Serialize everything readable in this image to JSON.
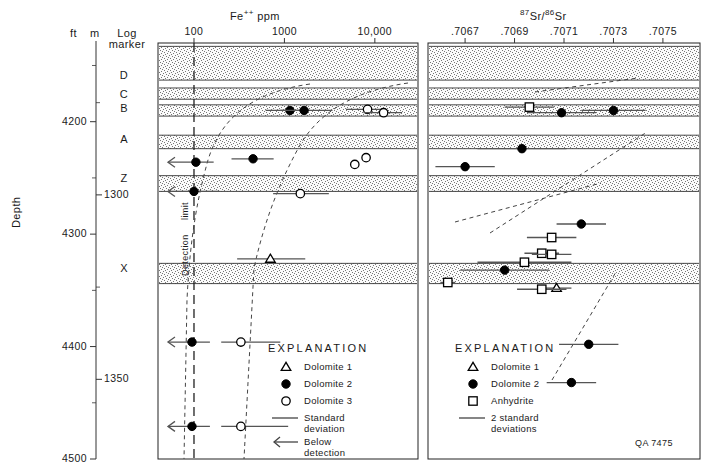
{
  "figure": {
    "id_label": "QA 7475",
    "depth_axis": {
      "axis_title": "Depth",
      "unit_left": "ft",
      "unit_right": "m",
      "ft_labels": [
        "4200",
        "4300",
        "4400",
        "4500"
      ],
      "ft_values": [
        4200,
        4300,
        4400,
        4500
      ],
      "m_labels": [
        "1300",
        "1350"
      ],
      "m_values": [
        1300,
        1350
      ],
      "ft_range": [
        4130,
        4500
      ]
    },
    "log_marker": {
      "header_line1": "Log",
      "header_line2": "marker",
      "markers": [
        {
          "label": "D",
          "depth_ft": 4160
        },
        {
          "label": "C",
          "depth_ft": 4177
        },
        {
          "label": "B",
          "depth_ft": 4190
        },
        {
          "label": "A",
          "depth_ft": 4217
        },
        {
          "label": "Z",
          "depth_ft": 4252
        },
        {
          "label": "X",
          "depth_ft": 4332
        }
      ]
    },
    "strat_bands": [
      {
        "top_ft": 4133,
        "bottom_ft": 4163
      },
      {
        "top_ft": 4170,
        "bottom_ft": 4180
      },
      {
        "top_ft": 4185,
        "bottom_ft": 4195
      },
      {
        "top_ft": 4212,
        "bottom_ft": 4224
      },
      {
        "top_ft": 4248,
        "bottom_ft": 4262
      },
      {
        "top_ft": 4326,
        "bottom_ft": 4344
      }
    ]
  },
  "chart_data": [
    {
      "type": "scatter",
      "panel": "left",
      "title": "Fe++ ppm",
      "title_base": "Fe",
      "title_sup": "++",
      "title_unit": "ppm",
      "xlabel": "Fe++ ppm",
      "ylabel": "Depth",
      "xscale": "log",
      "xlim": [
        40,
        30000
      ],
      "xticks": [
        100,
        1000,
        10000
      ],
      "xticklabels": [
        "100",
        "1000",
        "10,000"
      ],
      "ylim_ft": [
        4130,
        4500
      ],
      "grid": false,
      "detection_limit": {
        "value": 100,
        "label_line1": "Detection",
        "label_line2": "limit"
      },
      "series": [
        {
          "name": "Dolomite 1",
          "marker": "open-triangle",
          "points": [
            {
              "x": 700,
              "depth_ft": 4322,
              "err_lo": 300,
              "err_hi": 1700,
              "below_detection": false
            }
          ]
        },
        {
          "name": "Dolomite 2",
          "marker": "filled-circle",
          "points": [
            {
              "x": 1150,
              "depth_ft": 4190,
              "err_lo": 620,
              "err_hi": 1900,
              "below_detection": false
            },
            {
              "x": 1650,
              "depth_ft": 4190,
              "err_lo": 900,
              "err_hi": 3400,
              "below_detection": false
            },
            {
              "x": 105,
              "depth_ft": 4236,
              "err_lo": 70,
              "err_hi": 165,
              "below_detection": true
            },
            {
              "x": 450,
              "depth_ft": 4233,
              "err_lo": 260,
              "err_hi": 760,
              "below_detection": false
            },
            {
              "x": 100,
              "depth_ft": 4262,
              "err_lo": 70,
              "err_hi": 190,
              "below_detection": true
            },
            {
              "x": 95,
              "depth_ft": 4396,
              "err_lo": 70,
              "err_hi": 150,
              "below_detection": true
            },
            {
              "x": 95,
              "depth_ft": 4471,
              "err_lo": 70,
              "err_hi": 150,
              "below_detection": true
            }
          ]
        },
        {
          "name": "Dolomite 3",
          "marker": "open-circle",
          "points": [
            {
              "x": 8300,
              "depth_ft": 4189,
              "err_lo": 4800,
              "err_hi": 12000,
              "below_detection": false
            },
            {
              "x": 12500,
              "depth_ft": 4192,
              "err_lo": 7500,
              "err_hi": 20000,
              "below_detection": false
            },
            {
              "x": 6000,
              "depth_ft": 4238,
              "err_lo": 6000,
              "err_hi": 6000,
              "below_detection": false
            },
            {
              "x": 8000,
              "depth_ft": 4232,
              "err_lo": 8000,
              "err_hi": 8000,
              "below_detection": false
            },
            {
              "x": 1500,
              "depth_ft": 4264,
              "err_lo": 750,
              "err_hi": 3100,
              "below_detection": false
            },
            {
              "x": 330,
              "depth_ft": 4396,
              "err_lo": 200,
              "err_hi": 900,
              "below_detection": false
            },
            {
              "x": 330,
              "depth_ft": 4471,
              "err_lo": 200,
              "err_hi": 1100,
              "below_detection": false
            }
          ]
        }
      ],
      "trend_curves": [
        {
          "name": "dolomite-2-trend"
        },
        {
          "name": "dolomite-3-trend"
        }
      ],
      "legend": {
        "title": "EXPLANATION",
        "entries": [
          {
            "symbol": "open-triangle",
            "label": "Dolomite 1"
          },
          {
            "symbol": "filled-circle",
            "label": "Dolomite 2"
          },
          {
            "symbol": "open-circle",
            "label": "Dolomite 3"
          },
          {
            "symbol": "h-line",
            "label": "Standard deviation",
            "line1": "Standard",
            "line2": "deviation"
          },
          {
            "symbol": "left-arrow",
            "label": "Below detection",
            "line1": "Below",
            "line2": "detection"
          }
        ]
      }
    },
    {
      "type": "scatter",
      "panel": "right",
      "title": "87Sr/86Sr",
      "title_sup1": "87",
      "title_base1": "Sr",
      "title_slash": "/",
      "title_sup2": "86",
      "title_base2": "Sr",
      "xlabel": "87Sr/86Sr",
      "ylabel": "Depth",
      "xscale": "linear",
      "xlim": [
        0.70655,
        0.70765
      ],
      "xticks": [
        0.7067,
        0.7069,
        0.7071,
        0.7073,
        0.7075
      ],
      "xticklabels": [
        ".7067",
        ".7069",
        ".7071",
        ".7073",
        ".7075"
      ],
      "ylim_ft": [
        4130,
        4500
      ],
      "grid": false,
      "series": [
        {
          "name": "Dolomite 1",
          "marker": "open-triangle",
          "points": [
            {
              "x": 0.70707,
              "depth_ft": 4348,
              "err": 6e-05
            }
          ]
        },
        {
          "name": "Dolomite 2",
          "marker": "filled-circle",
          "points": [
            {
              "x": 0.70709,
              "depth_ft": 4192,
              "err": 0.00014
            },
            {
              "x": 0.7073,
              "depth_ft": 4190,
              "err": 0.00013
            },
            {
              "x": 0.70693,
              "depth_ft": 4224,
              "err": 0.00018
            },
            {
              "x": 0.7067,
              "depth_ft": 4240,
              "err": 0.00012
            },
            {
              "x": 0.70717,
              "depth_ft": 4291,
              "err": 0.0001
            },
            {
              "x": 0.70686,
              "depth_ft": 4332,
              "err": 0.00018
            },
            {
              "x": 0.7072,
              "depth_ft": 4398,
              "err": 0.00012
            },
            {
              "x": 0.70713,
              "depth_ft": 4432,
              "err": 0.0001
            }
          ]
        },
        {
          "name": "Anhydrite",
          "marker": "open-square",
          "points": [
            {
              "x": 0.70696,
              "depth_ft": 4187,
              "err": 0.0001
            },
            {
              "x": 0.70705,
              "depth_ft": 4303,
              "err": 0.0001
            },
            {
              "x": 0.70701,
              "depth_ft": 4317,
              "err": 7e-05
            },
            {
              "x": 0.70705,
              "depth_ft": 4318,
              "err": 8e-05
            },
            {
              "x": 0.70694,
              "depth_ft": 4325,
              "err": 0.00019
            },
            {
              "x": 0.70663,
              "depth_ft": 4343,
              "err": 3e-05
            },
            {
              "x": 0.70701,
              "depth_ft": 4349,
              "err": 0.0001
            }
          ]
        }
      ],
      "trend_curves": [
        {
          "name": "upper-trend"
        },
        {
          "name": "mid-trend"
        },
        {
          "name": "anhydrite-trend"
        },
        {
          "name": "lower-trend"
        }
      ],
      "legend": {
        "title": "EXPLANATION",
        "entries": [
          {
            "symbol": "open-triangle",
            "label": "Dolomite 1"
          },
          {
            "symbol": "filled-circle",
            "label": "Dolomite 2"
          },
          {
            "symbol": "open-square",
            "label": "Anhydrite"
          },
          {
            "symbol": "h-line",
            "label": "2 standard deviations",
            "line1": "2 standard",
            "line2": "deviations"
          }
        ]
      }
    }
  ]
}
